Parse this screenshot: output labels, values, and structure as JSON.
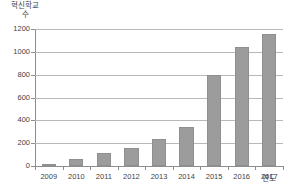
{
  "chart_data": {
    "type": "bar",
    "title": "",
    "xlabel": "연도",
    "ylabel": "혁신학교 수",
    "ylabel_line1": "혁신학교",
    "ylabel_line2": "수",
    "categories": [
      "2009",
      "2010",
      "2011",
      "2012",
      "2013",
      "2014",
      "2015",
      "2016",
      "2017"
    ],
    "values": [
      13,
      60,
      110,
      160,
      240,
      340,
      800,
      1040,
      1160
    ],
    "ylim": [
      0,
      1200
    ],
    "yticks": [
      0,
      200,
      400,
      600,
      800,
      1000,
      1200
    ],
    "ytick_labels": [
      "0",
      "200",
      "400",
      "600",
      "800",
      "1000",
      "1200"
    ],
    "grid": true,
    "legend": "none",
    "series_name": "혁신학교 수",
    "bar_color": "#9c9c9c",
    "grid_color": "#b8b8b8",
    "axis_color": "#8d8d8d",
    "text_color": "#3f3f3f",
    "background": "#ffffff"
  }
}
